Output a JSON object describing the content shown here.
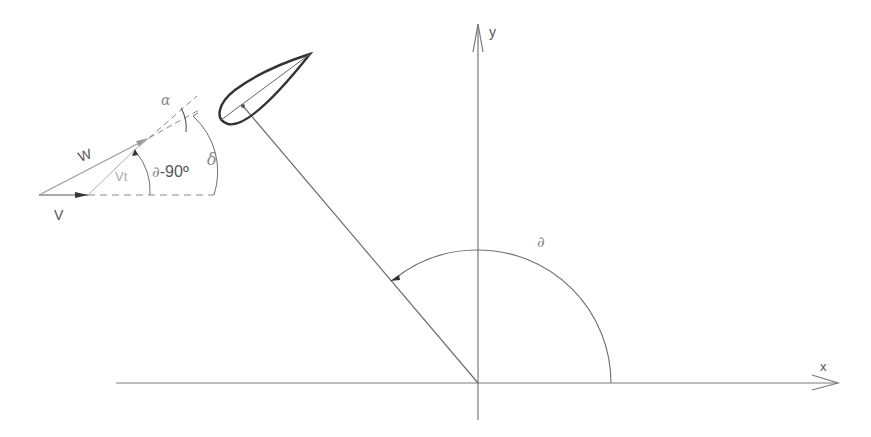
{
  "diagram": {
    "colors": {
      "background": "#ffffff",
      "line": "#7a7a7a",
      "light_line": "#b0b0b0",
      "blade": "#333333",
      "text": "#555555"
    },
    "axes": {
      "x_label": "x",
      "y_label": "y"
    },
    "labels": {
      "theta_main": "∂",
      "W": "W",
      "V": "V",
      "Vt": "Vt",
      "theta_minus_90": "∂-90º",
      "delta": "δ",
      "alpha": "α"
    },
    "elements": [
      "x-axis with arrow",
      "y-axis with arrow",
      "radius line from origin to blade pivot",
      "airfoil blade",
      "angle arc theta from x-axis to radius",
      "velocity triangle W, V, Vt",
      "dashed reference lines",
      "angle arcs alpha, delta, theta-90"
    ]
  }
}
